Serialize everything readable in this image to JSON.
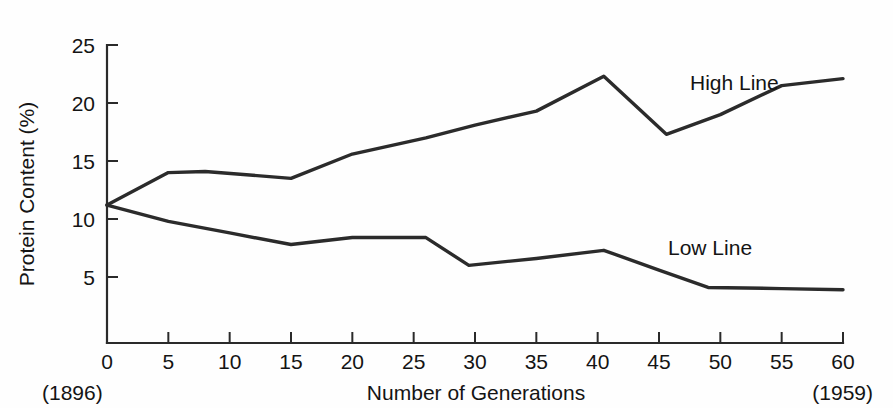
{
  "chart_data": {
    "type": "line",
    "title": "",
    "xlabel": "Number of Generations",
    "ylabel": "Protein Content (%)",
    "xlim": [
      0,
      60
    ],
    "ylim": [
      0,
      25
    ],
    "xticks": [
      0,
      5,
      10,
      15,
      20,
      25,
      30,
      35,
      40,
      45,
      50,
      55,
      60
    ],
    "yticks": [
      5,
      10,
      15,
      20,
      25
    ],
    "xtick_labels": [
      "0",
      "5",
      "10",
      "15",
      "20",
      "25",
      "30",
      "35",
      "40",
      "45",
      "50",
      "55",
      "60"
    ],
    "ytick_labels": [
      "5",
      "10",
      "15",
      "20",
      "25"
    ],
    "grid": false,
    "legend_position": "inline-annotation",
    "annotations": [
      {
        "text": "High Line",
        "x": 50.5,
        "y": 20.5
      },
      {
        "text": "Low Line",
        "x": 50.0,
        "y": 8.3
      },
      {
        "text": "(1896)",
        "x": 0,
        "y": -3.6
      },
      {
        "text": "(1959)",
        "x": 60,
        "y": -3.6
      }
    ],
    "series": [
      {
        "name": "High Line",
        "color": "#2b2b2b",
        "x": [
          0,
          5,
          8,
          15,
          20,
          26,
          30,
          35,
          40.5,
          45.6,
          50,
          55,
          60
        ],
        "values": [
          11.2,
          14.0,
          14.1,
          13.5,
          15.6,
          17.0,
          18.1,
          19.3,
          22.3,
          17.3,
          19.0,
          21.5,
          22.1
        ]
      },
      {
        "name": "Low Line",
        "color": "#2b2b2b",
        "x": [
          0,
          5,
          10,
          15,
          20,
          26,
          29.5,
          35,
          40.5,
          45,
          49,
          55,
          60
        ],
        "values": [
          11.2,
          9.8,
          8.8,
          7.8,
          8.4,
          8.4,
          6.0,
          6.6,
          7.3,
          5.6,
          4.1,
          4.0,
          3.9
        ]
      }
    ]
  },
  "figure": {
    "axis_color": "#2a2a2a",
    "background": "#fefefe",
    "y_axis_title": "Protein Content (%)",
    "x_axis_title": "Number of Generations",
    "start_year_note": "(1896)",
    "end_year_note": "(1959)",
    "high_line_label": "High Line",
    "low_line_label": "Low Line"
  }
}
